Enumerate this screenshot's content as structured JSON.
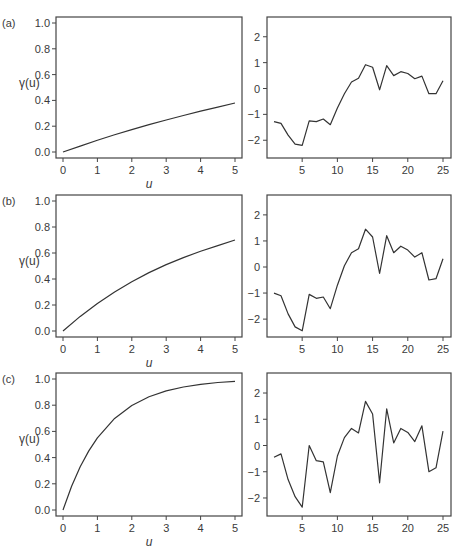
{
  "figure": {
    "rows": [
      {
        "label": "(a)"
      },
      {
        "label": "(b)"
      },
      {
        "label": "(c)"
      }
    ]
  },
  "chart_data": [
    {
      "panel": "(a) left",
      "type": "line",
      "title": "",
      "xlabel": "u",
      "ylabel": "γ(u)",
      "xlim": [
        0,
        5
      ],
      "ylim": [
        0,
        1
      ],
      "xticks": [
        "0",
        "1",
        "2",
        "3",
        "4",
        "5"
      ],
      "yticks": [
        "0.0",
        "0.2",
        "0.4",
        "0.6",
        "0.8",
        "1.0"
      ],
      "grid": false,
      "x": [
        0,
        0.5,
        1,
        1.5,
        2,
        2.5,
        3,
        3.5,
        4,
        4.5,
        5
      ],
      "values": [
        0.0,
        0.046,
        0.091,
        0.133,
        0.173,
        0.212,
        0.248,
        0.283,
        0.317,
        0.348,
        0.38
      ]
    },
    {
      "panel": "(a) right",
      "type": "line",
      "title": "",
      "xlabel": "",
      "ylabel": "",
      "xlim": [
        0,
        26
      ],
      "ylim": [
        -2.7,
        2.7
      ],
      "xticks": [
        "5",
        "10",
        "15",
        "20",
        "25"
      ],
      "yticks": [
        "-2",
        "-1",
        "0",
        "1",
        "2"
      ],
      "grid": false,
      "x": [
        1,
        2,
        3,
        4,
        5,
        6,
        7,
        8,
        9,
        10,
        11,
        12,
        13,
        14,
        15,
        16,
        17,
        18,
        19,
        20,
        21,
        22,
        23,
        24,
        25
      ],
      "values": [
        -1.28,
        -1.35,
        -1.8,
        -2.15,
        -2.2,
        -1.25,
        -1.28,
        -1.18,
        -1.4,
        -0.75,
        -0.2,
        0.25,
        0.4,
        0.92,
        0.82,
        -0.05,
        0.88,
        0.5,
        0.65,
        0.58,
        0.38,
        0.48,
        -0.2,
        -0.2,
        0.3
      ]
    },
    {
      "panel": "(b) left",
      "type": "line",
      "title": "",
      "xlabel": "u",
      "ylabel": "γ(u)",
      "xlim": [
        0,
        5
      ],
      "ylim": [
        0,
        1
      ],
      "xticks": [
        "0",
        "1",
        "2",
        "3",
        "4",
        "5"
      ],
      "yticks": [
        "0.0",
        "0.2",
        "0.4",
        "0.6",
        "0.8",
        "1.0"
      ],
      "grid": false,
      "x": [
        0,
        0.5,
        1,
        1.5,
        2,
        2.5,
        3,
        3.5,
        4,
        4.5,
        5
      ],
      "values": [
        0.0,
        0.112,
        0.212,
        0.3,
        0.379,
        0.449,
        0.511,
        0.565,
        0.614,
        0.657,
        0.7
      ]
    },
    {
      "panel": "(b) right",
      "type": "line",
      "title": "",
      "xlabel": "",
      "ylabel": "",
      "xlim": [
        0,
        26
      ],
      "ylim": [
        -2.7,
        2.7
      ],
      "xticks": [
        "5",
        "10",
        "15",
        "20",
        "25"
      ],
      "yticks": [
        "-2",
        "-1",
        "0",
        "1",
        "2"
      ],
      "grid": false,
      "x": [
        1,
        2,
        3,
        4,
        5,
        6,
        7,
        8,
        9,
        10,
        11,
        12,
        13,
        14,
        15,
        16,
        17,
        18,
        19,
        20,
        21,
        22,
        23,
        24,
        25
      ],
      "values": [
        -1.0,
        -1.1,
        -1.8,
        -2.3,
        -2.45,
        -1.05,
        -1.2,
        -1.15,
        -1.6,
        -0.7,
        0.05,
        0.55,
        0.7,
        1.45,
        1.15,
        -0.25,
        1.2,
        0.55,
        0.8,
        0.65,
        0.38,
        0.55,
        -0.5,
        -0.45,
        0.32
      ]
    },
    {
      "panel": "(c) left",
      "type": "line",
      "title": "",
      "xlabel": "u",
      "ylabel": "γ(u)",
      "xlim": [
        0,
        5
      ],
      "ylim": [
        0,
        1
      ],
      "xticks": [
        "0",
        "1",
        "2",
        "3",
        "4",
        "5"
      ],
      "yticks": [
        "0.0",
        "0.2",
        "0.4",
        "0.6",
        "0.8",
        "1.0"
      ],
      "grid": false,
      "x": [
        0,
        0.25,
        0.5,
        0.75,
        1,
        1.5,
        2,
        2.5,
        3,
        3.5,
        4,
        4.5,
        5
      ],
      "values": [
        0.0,
        0.181,
        0.33,
        0.451,
        0.551,
        0.699,
        0.798,
        0.865,
        0.909,
        0.939,
        0.959,
        0.973,
        0.982
      ]
    },
    {
      "panel": "(c) right",
      "type": "line",
      "title": "",
      "xlabel": "",
      "ylabel": "",
      "xlim": [
        0,
        26
      ],
      "ylim": [
        -2.7,
        2.7
      ],
      "xticks": [
        "5",
        "10",
        "15",
        "20",
        "25"
      ],
      "yticks": [
        "-2",
        "-1",
        "0",
        "1",
        "2"
      ],
      "grid": false,
      "x": [
        1,
        2,
        3,
        4,
        5,
        6,
        7,
        8,
        9,
        10,
        11,
        12,
        13,
        14,
        15,
        16,
        17,
        18,
        19,
        20,
        21,
        22,
        23,
        24,
        25
      ],
      "values": [
        -0.45,
        -0.32,
        -1.3,
        -1.95,
        -2.35,
        0.0,
        -0.58,
        -0.62,
        -1.8,
        -0.4,
        0.3,
        0.65,
        0.48,
        1.68,
        1.2,
        -1.42,
        1.4,
        0.1,
        0.65,
        0.5,
        0.15,
        0.75,
        -1.0,
        -0.85,
        0.55
      ]
    }
  ]
}
